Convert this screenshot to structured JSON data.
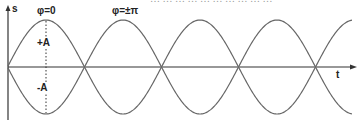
{
  "caption_fragment": "… … … … … … … … … …",
  "axes": {
    "y_label": "s",
    "x_label": "t"
  },
  "annotations": {
    "phase_zero": "φ=0",
    "phase_pi": "φ=±π",
    "plus_amplitude": "+A",
    "minus_amplitude": "-A"
  },
  "colors": {
    "curve": "#666666",
    "axis": "#333333",
    "text": "#222222"
  },
  "chart_data": {
    "type": "line",
    "title": "",
    "xlabel": "t",
    "ylabel": "s",
    "series": [
      {
        "name": "s = A cos(ωt)",
        "phase": "0",
        "amplitude": 1
      },
      {
        "name": "s = A cos(ωt ± π)",
        "phase": "±π",
        "amplitude": 1
      }
    ],
    "annotations": [
      "φ=0",
      "φ=±π",
      "+A",
      "-A"
    ],
    "periods_shown": 2.25,
    "grid": false
  }
}
